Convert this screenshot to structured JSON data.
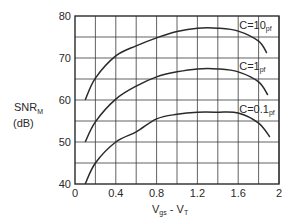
{
  "chart_data": {
    "type": "line",
    "title": "",
    "xlabel": "Vgs - VT",
    "xlabel_main": "V",
    "xlabel_sub1": "gs",
    "xlabel_mid": " - V",
    "xlabel_sub2": "T",
    "ylabel": "SNR_M (dB)",
    "ylabel_main": "SNR",
    "ylabel_sub": "M",
    "ylabel_unit": "(dB)",
    "xlim": [
      0,
      2
    ],
    "ylim": [
      40,
      80
    ],
    "grid": true,
    "x_ticks": [
      "0",
      "0.4",
      "0.8",
      "1.2",
      "1.6",
      "2"
    ],
    "y_ticks": [
      "40",
      "50",
      "60",
      "70",
      "80"
    ],
    "series": [
      {
        "name": "C=10pf",
        "label_main": "C=10",
        "label_sub": "pf",
        "x": [
          0.1,
          0.2,
          0.4,
          0.6,
          0.8,
          1.0,
          1.2,
          1.4,
          1.6,
          1.8,
          1.88
        ],
        "y": [
          60,
          65.2,
          70.5,
          72.9,
          74.8,
          76.3,
          77.1,
          77.1,
          76.4,
          74.0,
          71.2
        ]
      },
      {
        "name": "C=1pf",
        "label_main": "C=1",
        "label_sub": "pf",
        "x": [
          0.1,
          0.2,
          0.4,
          0.6,
          0.8,
          1.0,
          1.2,
          1.4,
          1.6,
          1.8,
          1.89
        ],
        "y": [
          50,
          54.8,
          60.2,
          63.3,
          65.5,
          66.7,
          67.4,
          67.4,
          66.7,
          64.3,
          61.2
        ]
      },
      {
        "name": "C=0.1pf",
        "label_main": "C=0.1",
        "label_sub": "pf",
        "x": [
          0.1,
          0.2,
          0.4,
          0.6,
          0.8,
          1.0,
          1.2,
          1.4,
          1.6,
          1.8,
          1.91
        ],
        "y": [
          40,
          45,
          50,
          52.4,
          55.5,
          56.6,
          57.1,
          57.1,
          56.9,
          54.5,
          51.2
        ]
      }
    ]
  }
}
